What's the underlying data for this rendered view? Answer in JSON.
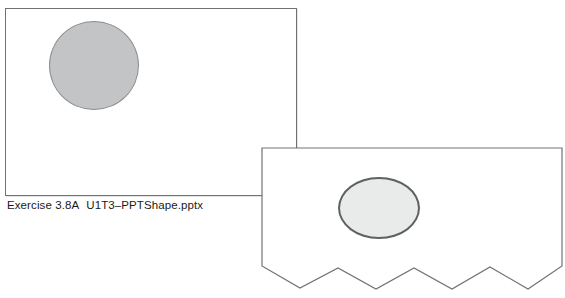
{
  "figure": {
    "caption": {
      "exercise_label": "Exercise 3.8A",
      "file_name": "U1T3–PPTShape.pptx"
    },
    "slides": [
      {
        "name": "slide-original",
        "shape_type": "circle",
        "shape_label": "circle-shape",
        "fill_color": "#c3c4c5",
        "outline_color": "#8b8d8f",
        "border_color": "#6f7275",
        "background_color": "#ffffff",
        "edge_style": "straight"
      },
      {
        "name": "slide-modified",
        "shape_type": "oval",
        "shape_label": "oval-shape",
        "fill_color": "#e9eaea",
        "outline_color": "#5e6164",
        "border_color": "#6f7275",
        "background_color": "#ffffff",
        "edge_style": "torn-zigzag"
      }
    ],
    "torn_edge": {
      "points": "0,118 38,140 76,120 114,141 152,120 190,141 228,119 266,141 300,118",
      "peaks": 4,
      "valleys": 4
    }
  }
}
